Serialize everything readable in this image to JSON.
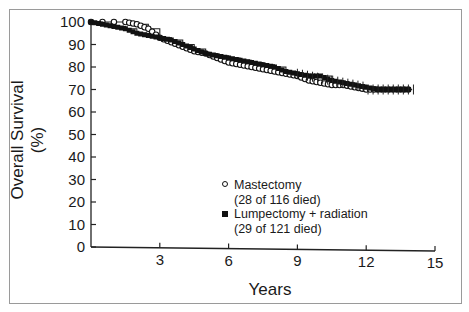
{
  "chart_data": {
    "type": "line",
    "subtype": "kaplan-meier",
    "title": "",
    "xlabel": "Years",
    "ylabel": "Overall Survival (%)",
    "xlim": [
      0,
      15
    ],
    "ylim": [
      0,
      100
    ],
    "xticks": [
      3,
      6,
      9,
      12,
      15
    ],
    "yticks": [
      0,
      10,
      20,
      30,
      40,
      50,
      60,
      70,
      80,
      90,
      100
    ],
    "grid": false,
    "legend_position": "center-right inside plot",
    "series": [
      {
        "name": "Mastectomy",
        "note": "(28 of 116 died)",
        "marker": "open-circle",
        "x": [
          0,
          1.5,
          2.0,
          2.5,
          3.0,
          3.5,
          4.0,
          4.5,
          5.0,
          5.5,
          6.0,
          6.5,
          7.0,
          7.5,
          8.0,
          8.5,
          9.0,
          9.5,
          10.0,
          10.5,
          11.0,
          11.5,
          12.0,
          12.5,
          13.0,
          13.5,
          14.0
        ],
        "values": [
          100,
          100,
          99,
          97,
          93,
          91,
          89,
          87,
          86,
          84,
          82,
          81,
          80,
          79,
          78,
          77,
          76,
          74,
          73,
          72,
          72,
          71,
          70,
          70,
          70,
          70,
          70
        ]
      },
      {
        "name": "Lumpectomy + radiation",
        "note": "(29 of 121 died)",
        "marker": "filled-square",
        "x": [
          0,
          0.5,
          1.0,
          1.5,
          2.0,
          2.5,
          3.0,
          3.5,
          4.0,
          4.5,
          5.0,
          5.5,
          6.0,
          6.5,
          7.0,
          7.5,
          8.0,
          8.5,
          9.0,
          9.5,
          10.0,
          10.5,
          11.0,
          11.5,
          12.0,
          12.5,
          13.0,
          13.5,
          14.0
        ],
        "values": [
          100,
          99,
          98,
          97,
          95,
          94,
          93,
          92,
          90,
          88,
          86,
          85,
          84,
          83,
          82,
          81,
          80,
          78,
          77,
          76,
          76,
          74,
          73,
          72,
          71,
          70,
          70,
          70,
          70
        ]
      }
    ]
  },
  "legend": {
    "s1_label": "Mastectomy",
    "s1_note": "(28 of 116 died)",
    "s2_label": "Lumpectomy + radiation",
    "s2_note": "(29 of 121 died)"
  },
  "axes": {
    "xlabel": "Years",
    "ylabel": "Overall Survival (%)"
  }
}
